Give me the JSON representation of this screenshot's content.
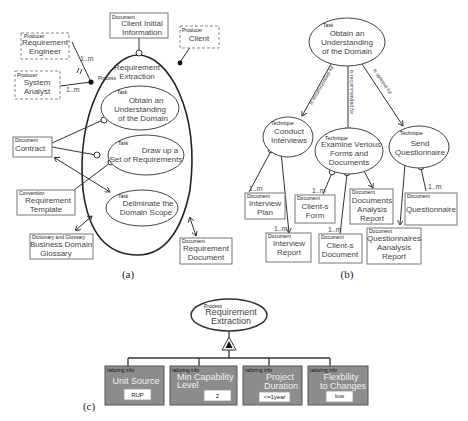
{
  "colors": {
    "tailoring_box": "#8c8c8c",
    "line": "#333333",
    "background": "#ffffff"
  },
  "captions": {
    "a": "(a)",
    "b": "(b)",
    "c": "(c)"
  },
  "panel_a": {
    "process": {
      "tag": "Process",
      "line1": "Requirement",
      "line2": "Extraction"
    },
    "producers": [
      {
        "tag": "Producer",
        "line1": "Requirement",
        "line2": "Engineer",
        "mult": "1..m"
      },
      {
        "tag": "Producer",
        "line1": "System",
        "line2": "Analyst",
        "mult": "1..m"
      },
      {
        "tag": "Producer",
        "line1": "Client"
      }
    ],
    "client_initial_info": {
      "tag": "Document",
      "line1": "Client Initial",
      "line2": "Information"
    },
    "tasks": [
      {
        "tag": "Task",
        "line1": "Obtain an",
        "line2": "Understanding",
        "line3": "of the Domain"
      },
      {
        "tag": "Task",
        "line1": "Draw up a",
        "line2": "Set of Requirements"
      },
      {
        "tag": "Task",
        "line1": "Deliminate the",
        "line2": "Domain Scope"
      }
    ],
    "contract": {
      "tag": "Document",
      "line1": "Contract"
    },
    "template": {
      "tag": "Convention",
      "line1": "Requirement",
      "line2": "Template"
    },
    "glossary": {
      "tag": "Dictionary and Glossary",
      "line1": "Business Domain",
      "line2": "Glossary"
    },
    "req_document": {
      "tag": "Document",
      "line1": "Requirement",
      "line2": "Document"
    }
  },
  "panel_b": {
    "task": {
      "tag": "Task",
      "line1": "Obtain an",
      "line2": "Understanding",
      "line3": "of the Domain"
    },
    "relations": [
      "is recommended for",
      "is recommended for",
      "is optional for"
    ],
    "techniques": [
      {
        "tag": "Technique",
        "line1": "Conduct",
        "line2": "Interviews"
      },
      {
        "tag": "Technique",
        "line1": "Examine Verious",
        "line2": "Forms and",
        "line3": "Documents"
      },
      {
        "tag": "Technique",
        "line1": "Send",
        "line2": "Questionnaire"
      }
    ],
    "documents": [
      {
        "tag": "Document",
        "line1": "Interview",
        "line2": "Plan",
        "mult": "1..m"
      },
      {
        "tag": "Document",
        "line1": "Interview",
        "line2": "Report",
        "mult": "1..m"
      },
      {
        "tag": "Document",
        "line1": "Client-s",
        "line2": "Form",
        "mult": "1..m"
      },
      {
        "tag": "Document",
        "line1": "Client-s",
        "line2": "Document",
        "mult": "1..m"
      },
      {
        "tag": "Document",
        "line1": "Documents",
        "line2": "Analysis",
        "line3": "Report"
      },
      {
        "tag": "Document",
        "line1": "Questionnaire",
        "mult": "1..m"
      },
      {
        "tag": "Document",
        "line1": "Questionnaires",
        "line2": "Aanalysis",
        "line3": "Report"
      }
    ]
  },
  "panel_c": {
    "process": {
      "tag": "Process",
      "line1": "Requirement",
      "line2": "Extraction"
    },
    "tailoring": [
      {
        "tag": "tailoring info",
        "line1": "Unit Source",
        "line2": "",
        "value": "RUP"
      },
      {
        "tag": "tailoring info",
        "line1": "Min Capability",
        "line2": "Level",
        "value": "2"
      },
      {
        "tag": "tailoring info",
        "line1": "Project",
        "line2": "Duration",
        "value": "<=1year"
      },
      {
        "tag": "tailoring info",
        "line1": "Flexbility",
        "line2": "to Changes",
        "value": "low"
      }
    ]
  }
}
